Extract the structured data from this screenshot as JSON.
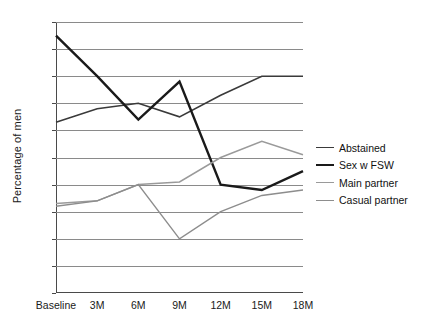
{
  "chart_data": {
    "type": "line",
    "title": "",
    "xlabel": "",
    "ylabel": "Percentage of men",
    "categories": [
      "Baseline",
      "3M",
      "6M",
      "9M",
      "12M",
      "15M",
      "18M"
    ],
    "ylim": [
      0,
      50
    ],
    "ytick_step": 5,
    "yticks": [
      0,
      5,
      10,
      15,
      20,
      25,
      30,
      35,
      40,
      45,
      50
    ],
    "grid": true,
    "legend_position": "right",
    "series": [
      {
        "name": "Abstained",
        "color": "#3a3a3a",
        "width": 1.6,
        "values": [
          31.5,
          34,
          35,
          32.5,
          36.5,
          40,
          40
        ]
      },
      {
        "name": "Sex w FSW",
        "color": "#1a1a1a",
        "width": 2.4,
        "values": [
          47.5,
          40,
          32,
          39,
          20,
          19,
          22.5
        ]
      },
      {
        "name": "Main partner",
        "color": "#9a9a9a",
        "width": 1.5,
        "values": [
          16.5,
          17,
          20,
          20.5,
          25,
          28,
          25.5
        ]
      },
      {
        "name": "Casual partner",
        "color": "#8d8d8d",
        "width": 1.4,
        "values": [
          16,
          17,
          20,
          10,
          15,
          18,
          19
        ]
      }
    ]
  }
}
